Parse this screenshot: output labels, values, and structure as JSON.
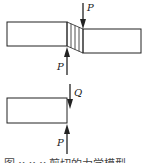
{
  "figure": {
    "top_panel": {
      "force_down_label": "P",
      "force_up_label": "P",
      "description": "Shear deformation: two blocks offset with hatched sheared zone between opposing forces P"
    },
    "bottom_panel": {
      "force_down_label": "Q",
      "force_up_label": "P",
      "description": "Free body of left block with shear force Q and applied force P"
    },
    "caption": "图 x-x-x  剪切的力学模型"
  },
  "colors": {
    "stroke": "#222222",
    "background": "#ffffff"
  }
}
